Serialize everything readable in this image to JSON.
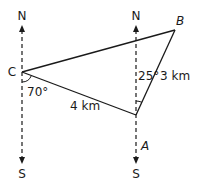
{
  "diagram": {
    "type": "bearing-triangle",
    "points": {
      "C": {
        "label": "C",
        "italic": false
      },
      "A": {
        "label": "A",
        "italic": true
      },
      "B": {
        "label": "B",
        "italic": true
      }
    },
    "compass": {
      "left": {
        "north": "N",
        "south": "S"
      },
      "right": {
        "north": "N",
        "south": "S"
      }
    },
    "edges": {
      "CA": {
        "label": "4 km"
      },
      "AB": {
        "label": "3 km"
      },
      "CB": {
        "label": ""
      }
    },
    "angles": {
      "at_C": {
        "label": "70°"
      },
      "at_A": {
        "label": "25°"
      }
    },
    "colors": {
      "line": "#1a1a1a",
      "background": "#ffffff"
    }
  }
}
